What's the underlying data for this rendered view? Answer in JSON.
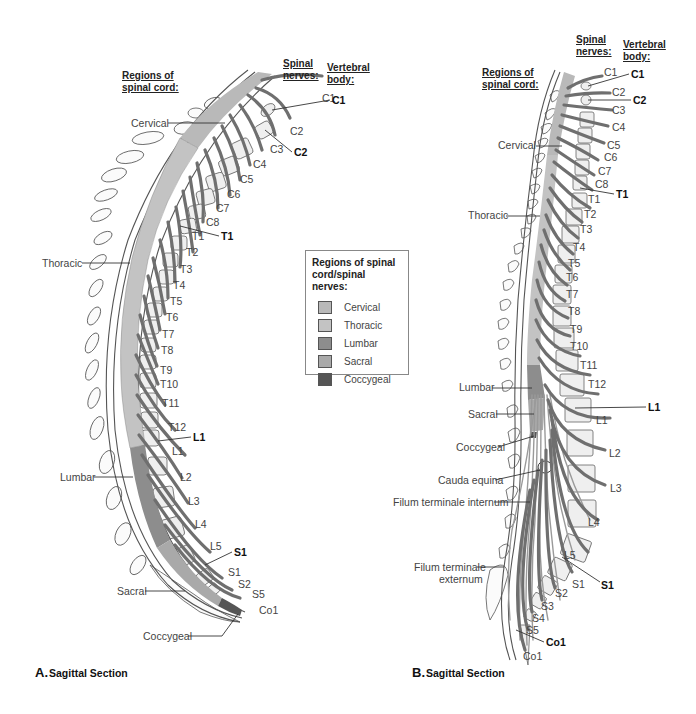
{
  "legend": {
    "title_line1": "Regions of spinal",
    "title_line2": "cord/spinal nerves:",
    "items": [
      {
        "label": "Cervical",
        "color": "#b9b9b9"
      },
      {
        "label": "Thoracic",
        "color": "#c3c3c3"
      },
      {
        "label": "Lumbar",
        "color": "#8d8d8d"
      },
      {
        "label": "Sacral",
        "color": "#a9a9a9"
      },
      {
        "label": "Coccygeal",
        "color": "#555555"
      }
    ]
  },
  "panel_a": {
    "caption_letter": "A.",
    "caption_text": "Sagittal Section",
    "header_regions_1": "Regions of",
    "header_regions_2": "spinal cord:",
    "header_nerves_1": "Spinal",
    "header_nerves_2": "nerves:",
    "header_body_1": "Vertebral",
    "header_body_2": "body:",
    "regions": [
      "Cervical",
      "Thoracic",
      "Lumbar",
      "Sacral",
      "Coccygeal"
    ],
    "nerves": [
      "C1",
      "C2",
      "C3",
      "C4",
      "C5",
      "C6",
      "C7",
      "C8",
      "T1",
      "T2",
      "T3",
      "T4",
      "T5",
      "T6",
      "T7",
      "T8",
      "T9",
      "T10",
      "T11",
      "T12",
      "L1",
      "L2",
      "L3",
      "L4",
      "L5",
      "S1",
      "S2",
      "S5",
      "Co1"
    ],
    "vertebral_bodies": [
      "C1",
      "C2",
      "T1",
      "L1",
      "S1"
    ]
  },
  "panel_b": {
    "caption_letter": "B.",
    "caption_text": "Sagittal Section",
    "header_regions_1": "Regions of",
    "header_regions_2": "spinal cord:",
    "header_nerves_1": "Spinal",
    "header_nerves_2": "nerves:",
    "header_body_1": "Vertebral",
    "header_body_2": "body:",
    "regions": [
      "Cervical",
      "Thoracic",
      "Lumbar",
      "Sacral",
      "Coccygeal"
    ],
    "structures": [
      "Cauda equina",
      "Filum terminale internum",
      "Filum terminale",
      "externum"
    ],
    "nerves": [
      "C1",
      "C2",
      "C3",
      "C4",
      "C5",
      "C6",
      "C7",
      "C8",
      "T1",
      "T2",
      "T3",
      "T4",
      "T5",
      "T6",
      "T7",
      "T8",
      "T9",
      "T10",
      "T11",
      "T12",
      "L1",
      "L2",
      "L3",
      "L4",
      "L5",
      "S1",
      "S2",
      "S3",
      "S4",
      "S5",
      "Co1"
    ],
    "vertebral_bodies": [
      "C1",
      "C2",
      "T1",
      "L1",
      "S1",
      "Co1"
    ]
  }
}
